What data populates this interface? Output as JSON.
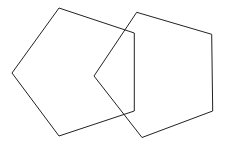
{
  "diagram": {
    "background": "#ffffff",
    "stroke_color": "#222222",
    "stroke_width": 1,
    "shapes": [
      {
        "name": "left-pentagon",
        "type": "pentagon",
        "points": "59,8 134.3,33 134.3,111 59,136 12,73"
      },
      {
        "name": "right-pentagon",
        "type": "pentagon",
        "points": "136.7,12.3 211.7,34.3 212.7,111 142,137.5 94,76"
      }
    ]
  }
}
